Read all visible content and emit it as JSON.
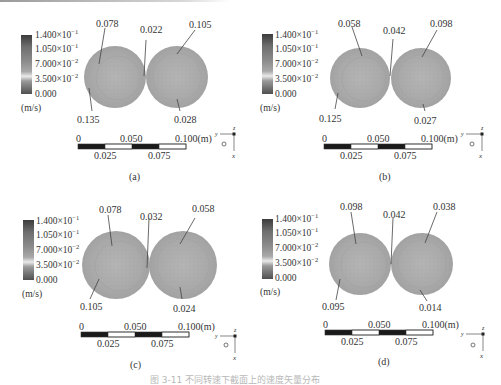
{
  "figure": {
    "caption": "图 3-11  不同转速下截面上的速度矢量分布",
    "colorbar": {
      "ticks": [
        "1.400×10",
        "1.050×10",
        "7.000×10",
        "3.500×10",
        "0.000"
      ],
      "exponents": [
        "−1",
        "−1",
        "−2",
        "−2",
        ""
      ],
      "unit": "(m/s)",
      "colors": [
        "#3a3a3a",
        "#6a6a6a",
        "#8a8a8a",
        "#e6e6e6",
        "#7e7e7e",
        "#4a4a4a"
      ]
    },
    "scale_bar": {
      "top_ticks": [
        "0",
        "0.050",
        "0.100(m)"
      ],
      "bottom_ticks": [
        "0.025",
        "0.075"
      ]
    },
    "axes_triad": {
      "y": "y",
      "z": "z",
      "x": "x"
    },
    "panels": [
      {
        "id": "a",
        "label": "(a)",
        "annotations": {
          "left_top": "0.078",
          "middle": "0.022",
          "right_top": "0.105",
          "left_bottom": "0.135",
          "right_bottom": "0.028"
        }
      },
      {
        "id": "b",
        "label": "(b)",
        "annotations": {
          "left_top": "0.058",
          "middle": "0.042",
          "right_top": "0.098",
          "left_bottom": "0.125",
          "right_bottom": "0.027"
        }
      },
      {
        "id": "c",
        "label": "(c)",
        "annotations": {
          "left_top": "0.078",
          "middle": "0.032",
          "right_top": "0.058",
          "left_bottom": "0.105",
          "right_bottom": "0.024"
        }
      },
      {
        "id": "d",
        "label": "(d)",
        "annotations": {
          "left_top": "0.098",
          "middle": "0.042",
          "right_top": "0.038",
          "left_bottom": "0.095",
          "right_bottom": "0.014"
        }
      }
    ]
  }
}
